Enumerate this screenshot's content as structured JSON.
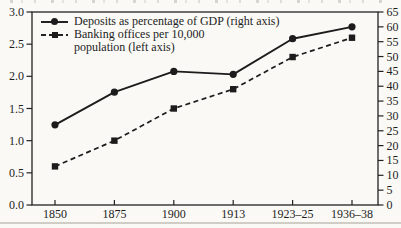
{
  "figure": {
    "background": "#faf9f5",
    "ink": "#222222",
    "bottom_rule_color": "#c7c5bd"
  },
  "legend": {
    "entries": [
      {
        "label": "Deposits as percentage of GDP (right axis)",
        "marker": "circle",
        "line": "solid"
      },
      {
        "label_line1": "Banking offices per 10,000",
        "label_line2": "population (left axis)",
        "marker": "square",
        "line": "dashed"
      }
    ]
  },
  "chart_data": {
    "type": "line",
    "categories": [
      "1850",
      "1875",
      "1900",
      "1913",
      "1923–25",
      "1936–38"
    ],
    "series": [
      {
        "name": "Deposits as percentage of GDP",
        "axis": "right",
        "marker": "circle",
        "line_style": "solid",
        "values": [
          27,
          38,
          45,
          44,
          56,
          60
        ]
      },
      {
        "name": "Banking offices per 10,000 population",
        "axis": "left",
        "marker": "square",
        "line_style": "dashed",
        "values": [
          0.6,
          1.0,
          1.5,
          1.8,
          2.3,
          2.6
        ]
      }
    ],
    "left_axis": {
      "min": 0,
      "max": 3,
      "step": 0.5,
      "tick_labels": [
        "3.0",
        "2.5",
        "2.0",
        "1.5",
        "1.0",
        "0.5",
        "0.0"
      ]
    },
    "right_axis": {
      "min": 0,
      "max": 65,
      "step": 5,
      "tick_labels": [
        "65",
        "60",
        "55",
        "50",
        "45",
        "40",
        "35",
        "30",
        "25",
        "20",
        "15",
        "10",
        "5",
        "0"
      ]
    },
    "grid": false,
    "legend_position": "top-left"
  }
}
